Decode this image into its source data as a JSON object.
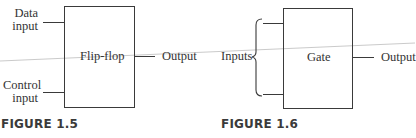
{
  "figure_1_5": {
    "block_label": "Flip-flop",
    "input_top_line1": "Data",
    "input_top_line2": "input",
    "input_bottom_line1": "Control",
    "input_bottom_line2": "input",
    "output_label": "Output",
    "caption": "FIGURE 1.5"
  },
  "figure_1_6": {
    "block_label": "Gate",
    "inputs_label": "Inputs",
    "output_label": "Output",
    "caption": "FIGURE 1.6"
  },
  "colors": {
    "line": "#3a3a3a",
    "text": "#333333",
    "stray_line": "#b8b8b8"
  }
}
